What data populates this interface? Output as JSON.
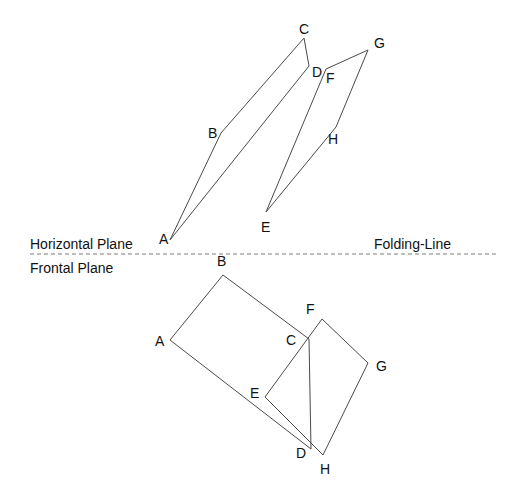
{
  "diagram": {
    "colors": {
      "line": "#4a4a4a",
      "fold_line": "#7a7a7a",
      "text": "#111111",
      "background": "#ffffff"
    },
    "plane_labels": {
      "horizontal": "Horizontal Plane",
      "frontal": "Frontal Plane",
      "folding_line": "Folding-Line"
    },
    "folding_line": {
      "x1": 30,
      "y1": 254,
      "x2": 498,
      "y2": 254
    },
    "horizontal_view": {
      "vertices": {
        "A": {
          "x": 170,
          "y": 240,
          "label": "A",
          "lx": 159,
          "ly": 244
        },
        "B": {
          "x": 221,
          "y": 133,
          "label": "B",
          "lx": 208,
          "ly": 138
        },
        "C": {
          "x": 304,
          "y": 38,
          "label": "C",
          "lx": 299,
          "ly": 34
        },
        "D": {
          "x": 309,
          "y": 66,
          "label": "D",
          "lx": 312,
          "ly": 77
        },
        "E": {
          "x": 266,
          "y": 212,
          "label": "E",
          "lx": 261,
          "ly": 232
        },
        "F": {
          "x": 326,
          "y": 69,
          "label": "F",
          "lx": 326,
          "ly": 83
        },
        "G": {
          "x": 368,
          "y": 50,
          "label": "G",
          "lx": 374,
          "ly": 48
        },
        "H": {
          "x": 336,
          "y": 127,
          "label": "H",
          "lx": 328,
          "ly": 144
        }
      },
      "edges": [
        [
          "A",
          "B"
        ],
        [
          "B",
          "C"
        ],
        [
          "C",
          "D"
        ],
        [
          "D",
          "A"
        ],
        [
          "E",
          "F"
        ],
        [
          "F",
          "G"
        ],
        [
          "G",
          "H"
        ],
        [
          "H",
          "E"
        ]
      ]
    },
    "frontal_view": {
      "vertices": {
        "A": {
          "x": 170,
          "y": 340,
          "label": "A",
          "lx": 155,
          "ly": 346
        },
        "B": {
          "x": 223,
          "y": 275,
          "label": "B",
          "lx": 217,
          "ly": 266
        },
        "C": {
          "x": 309,
          "y": 339,
          "label": "C",
          "lx": 286,
          "ly": 345
        },
        "D": {
          "x": 311,
          "y": 449,
          "label": "D",
          "lx": 296,
          "ly": 458
        },
        "E": {
          "x": 265,
          "y": 397,
          "label": "E",
          "lx": 250,
          "ly": 398
        },
        "F": {
          "x": 322,
          "y": 319,
          "label": "F",
          "lx": 306,
          "ly": 314
        },
        "G": {
          "x": 368,
          "y": 363,
          "label": "G",
          "lx": 376,
          "ly": 371
        },
        "H": {
          "x": 323,
          "y": 455,
          "label": "H",
          "lx": 320,
          "ly": 474
        }
      },
      "edges": [
        [
          "A",
          "B"
        ],
        [
          "B",
          "C"
        ],
        [
          "C",
          "D"
        ],
        [
          "D",
          "A"
        ],
        [
          "E",
          "F"
        ],
        [
          "F",
          "G"
        ],
        [
          "G",
          "H"
        ],
        [
          "H",
          "E"
        ]
      ]
    }
  }
}
